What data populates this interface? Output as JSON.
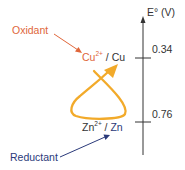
{
  "axis": {
    "label": "E° (V)",
    "ticks": [
      {
        "label": "0.34",
        "couple": "Cu2+/Cu"
      },
      {
        "label": "0.76",
        "couple": "Zn2+/Zn"
      }
    ]
  },
  "couples": {
    "upper": {
      "species": "Cu",
      "charge": "2+",
      "sep": " / ",
      "reduced": "Cu"
    },
    "lower": {
      "species": "Zn",
      "charge": "2+",
      "sep": " / ",
      "reduced": "Zn"
    }
  },
  "annotations": {
    "oxidant": "Oxidant",
    "reductant": "Reductant"
  },
  "colors": {
    "oxidant": "#e0663a",
    "reductant": "#2b3a7a",
    "loop": "#f2aa2a",
    "axis": "#333333",
    "text": "#333333"
  }
}
